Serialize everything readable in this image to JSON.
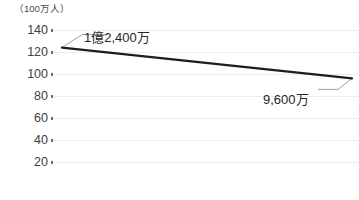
{
  "chart_data": {
    "type": "line",
    "title": "",
    "unit_note": "（100万人）",
    "ylabel": "",
    "xlabel": "",
    "ylim": [
      10,
      150
    ],
    "yticks": [
      140,
      120,
      100,
      80,
      60,
      40,
      20
    ],
    "ytick_labels": [
      "140",
      "120",
      "100",
      "80",
      "60",
      "40",
      "20"
    ],
    "grid": true,
    "legend": "none",
    "series": [
      {
        "name": "人口",
        "x": [
          0,
          100
        ],
        "values": [
          124,
          96
        ],
        "color": "#1d1d1d"
      }
    ],
    "annotations": [
      {
        "name": "start-value",
        "text": "1億2,400万",
        "value": 124,
        "anchor_x": 0,
        "anchor_y": 124
      },
      {
        "name": "end-value",
        "text": "9,600万",
        "value": 96,
        "anchor_x": 100,
        "anchor_y": 96
      }
    ]
  },
  "colors": {
    "line": "#1d1d1d",
    "grid": "#ededed",
    "text": "#404040",
    "annotation_text": "#262626",
    "leader": "#8a8a8a",
    "background": "#ffffff"
  },
  "geometry": {
    "plot_left": 52,
    "plot_right": 359,
    "y_for_140": 30,
    "y_step_per_20": 22
  }
}
